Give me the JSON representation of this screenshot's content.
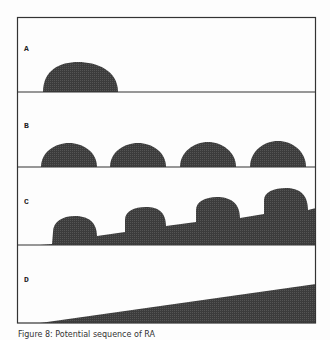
{
  "figure": {
    "panels": [
      {
        "label": "A"
      },
      {
        "label": "B"
      },
      {
        "label": "C"
      },
      {
        "label": "D"
      }
    ],
    "caption": "Figure 8: Potential sequence of RA",
    "colors": {
      "fill": "#3a3a3a",
      "border": "#333333",
      "background": "#fdfdfd"
    }
  }
}
